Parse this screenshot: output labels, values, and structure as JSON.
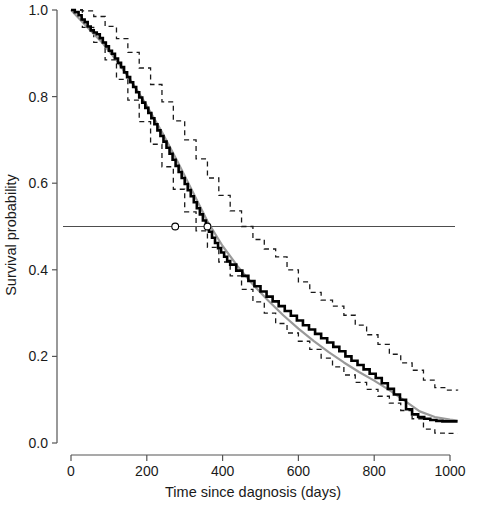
{
  "figure": {
    "background_color": "#ffffff",
    "width": 480,
    "height": 507
  },
  "chart_data": {
    "type": "line",
    "subtype": "kaplan-meier-survival",
    "title": "",
    "xlabel": "Time since dagnosis (days)",
    "ylabel": "Survival probability",
    "xlim": [
      0,
      1020
    ],
    "ylim": [
      0.0,
      1.0
    ],
    "grid": false,
    "legend": null,
    "xticks": [
      0,
      200,
      400,
      600,
      800,
      1000
    ],
    "xtick_labels": [
      "0",
      "200",
      "400",
      "600",
      "800",
      "1000"
    ],
    "yticks": [
      0.0,
      0.2,
      0.4,
      0.6,
      0.8,
      1.0
    ],
    "ytick_labels": [
      "0.0",
      "0.2",
      "0.4",
      "0.6",
      "0.8",
      "1.0"
    ],
    "colors": {
      "survival_curve": "#000000",
      "fitted_curve": "#9a9a9a",
      "confidence_band": "#1a1a1a",
      "median_line": "#4d4d4d",
      "axis": "#555555"
    },
    "median_reference": {
      "label": "median survival reference",
      "y": 0.5,
      "x_start": 0,
      "x_end": 1020
    },
    "median_markers": [
      {
        "label": "median-marker-1",
        "x": 275,
        "y": 0.5
      },
      {
        "label": "median-marker-2",
        "x": 360,
        "y": 0.5
      }
    ],
    "series": [
      {
        "name": "Kaplan-Meier survival estimate",
        "style": "step",
        "linewidth": 2.6,
        "color": "#000000",
        "x": [
          0,
          10,
          20,
          28,
          36,
          44,
          52,
          60,
          68,
          76,
          84,
          92,
          100,
          108,
          116,
          124,
          132,
          140,
          148,
          156,
          164,
          172,
          180,
          188,
          196,
          204,
          212,
          220,
          228,
          236,
          244,
          252,
          260,
          268,
          276,
          284,
          292,
          300,
          308,
          316,
          324,
          332,
          340,
          348,
          356,
          364,
          372,
          380,
          388,
          396,
          404,
          412,
          420,
          436,
          452,
          468,
          484,
          500,
          516,
          532,
          548,
          564,
          580,
          596,
          612,
          628,
          644,
          660,
          676,
          692,
          708,
          724,
          740,
          756,
          772,
          788,
          804,
          820,
          836,
          852,
          868,
          884,
          900,
          916,
          932,
          948,
          964,
          980,
          996,
          1020
        ],
        "y": [
          1.0,
          0.995,
          0.988,
          0.978,
          0.972,
          0.962,
          0.953,
          0.948,
          0.944,
          0.935,
          0.925,
          0.916,
          0.906,
          0.899,
          0.888,
          0.878,
          0.868,
          0.856,
          0.845,
          0.833,
          0.822,
          0.81,
          0.798,
          0.786,
          0.774,
          0.762,
          0.75,
          0.736,
          0.722,
          0.709,
          0.696,
          0.682,
          0.668,
          0.654,
          0.64,
          0.626,
          0.612,
          0.598,
          0.584,
          0.57,
          0.556,
          0.542,
          0.528,
          0.514,
          0.5,
          0.488,
          0.474,
          0.462,
          0.45,
          0.44,
          0.43,
          0.42,
          0.412,
          0.398,
          0.386,
          0.374,
          0.362,
          0.35,
          0.338,
          0.327,
          0.316,
          0.305,
          0.294,
          0.283,
          0.272,
          0.262,
          0.252,
          0.242,
          0.232,
          0.222,
          0.212,
          0.2,
          0.19,
          0.18,
          0.17,
          0.16,
          0.15,
          0.138,
          0.125,
          0.112,
          0.1,
          0.078,
          0.066,
          0.06,
          0.056,
          0.053,
          0.051,
          0.05,
          0.05,
          0.05
        ]
      },
      {
        "name": "Model fitted survival",
        "style": "line",
        "linewidth": 2.2,
        "color": "#9a9a9a",
        "x": [
          0,
          40,
          80,
          120,
          160,
          200,
          240,
          280,
          320,
          360,
          400,
          440,
          480,
          520,
          560,
          600,
          640,
          680,
          720,
          760,
          800,
          840,
          880,
          920,
          960,
          1000,
          1020
        ],
        "y": [
          1.0,
          0.963,
          0.927,
          0.884,
          0.834,
          0.779,
          0.718,
          0.652,
          0.582,
          0.512,
          0.455,
          0.408,
          0.366,
          0.329,
          0.295,
          0.264,
          0.236,
          0.21,
          0.186,
          0.164,
          0.144,
          0.122,
          0.098,
          0.073,
          0.06,
          0.054,
          0.052
        ]
      },
      {
        "name": "Upper 95% confidence limit",
        "style": "dashed",
        "linewidth": 1.3,
        "color": "#1a1a1a",
        "x": [
          0,
          30,
          60,
          90,
          120,
          150,
          180,
          210,
          240,
          270,
          300,
          330,
          360,
          390,
          420,
          450,
          480,
          510,
          540,
          570,
          600,
          630,
          660,
          690,
          720,
          750,
          780,
          810,
          840,
          870,
          900,
          930,
          960,
          990,
          1020
        ],
        "y": [
          1.0,
          0.998,
          0.985,
          0.962,
          0.934,
          0.902,
          0.866,
          0.828,
          0.788,
          0.744,
          0.7,
          0.656,
          0.612,
          0.572,
          0.536,
          0.5,
          0.47,
          0.448,
          0.43,
          0.4,
          0.372,
          0.348,
          0.33,
          0.316,
          0.295,
          0.272,
          0.25,
          0.228,
          0.205,
          0.185,
          0.168,
          0.145,
          0.128,
          0.122,
          0.121
        ]
      },
      {
        "name": "Lower 95% confidence limit",
        "style": "dashed",
        "linewidth": 1.3,
        "color": "#1a1a1a",
        "x": [
          0,
          30,
          60,
          90,
          120,
          150,
          180,
          210,
          240,
          270,
          300,
          330,
          360,
          390,
          420,
          450,
          480,
          510,
          540,
          570,
          600,
          630,
          660,
          690,
          720,
          750,
          780,
          810,
          840,
          870,
          900,
          930,
          960,
          990,
          1020
        ],
        "y": [
          1.0,
          0.96,
          0.925,
          0.885,
          0.84,
          0.792,
          0.742,
          0.69,
          0.638,
          0.586,
          0.534,
          0.49,
          0.452,
          0.418,
          0.386,
          0.355,
          0.326,
          0.3,
          0.276,
          0.254,
          0.235,
          0.216,
          0.196,
          0.176,
          0.157,
          0.14,
          0.124,
          0.108,
          0.092,
          0.075,
          0.056,
          0.032,
          0.023,
          0.022,
          0.022
        ]
      }
    ]
  }
}
